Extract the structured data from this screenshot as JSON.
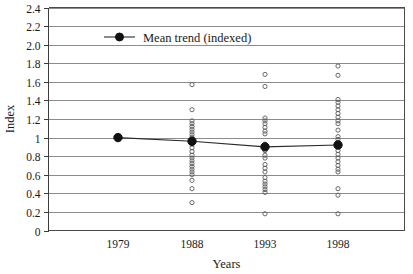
{
  "chart_data": {
    "type": "scatter",
    "title": "",
    "xlabel": "Years",
    "ylabel": "Index",
    "categories": [
      "1979",
      "1988",
      "1993",
      "1998"
    ],
    "ylim": [
      0,
      2.4
    ],
    "ytick_labels": [
      "2.4",
      "2.2",
      "2.0",
      "1.8",
      "1.6",
      "1.4",
      "1.2",
      "1",
      "0.8",
      "0.6",
      "0.4",
      "0.2",
      "0"
    ],
    "ytick_values": [
      2.4,
      2.2,
      2.0,
      1.8,
      1.6,
      1.4,
      1.2,
      1.0,
      0.8,
      0.6,
      0.4,
      0.2,
      0
    ],
    "grid": true,
    "legend_position": "top-left-inside",
    "legend": [
      {
        "name": "Mean trend (indexed)",
        "marker": "filled-circle",
        "line": "solid"
      }
    ],
    "series": [
      {
        "name": "Mean trend (indexed)",
        "type": "line",
        "x": [
          "1979",
          "1988",
          "1993",
          "1998"
        ],
        "values": [
          1.0,
          0.96,
          0.9,
          0.92
        ]
      },
      {
        "name": "Observations",
        "type": "scatter",
        "marker": "open-circle",
        "points_by_year": {
          "1979": [],
          "1988": [
            1.57,
            1.3,
            1.18,
            1.15,
            1.12,
            1.09,
            1.06,
            1.03,
            1.0,
            0.97,
            0.93,
            0.89,
            0.85,
            0.81,
            0.78,
            0.75,
            0.72,
            0.69,
            0.66,
            0.63,
            0.6,
            0.54,
            0.45,
            0.3
          ],
          "1993": [
            1.68,
            1.55,
            1.21,
            1.18,
            1.15,
            1.11,
            1.07,
            1.04,
            0.93,
            0.86,
            0.81,
            0.78,
            0.71,
            0.67,
            0.63,
            0.57,
            0.53,
            0.5,
            0.47,
            0.44,
            0.41,
            0.18
          ],
          "1998": [
            1.77,
            1.67,
            1.41,
            1.38,
            1.34,
            1.3,
            1.26,
            1.22,
            1.18,
            1.15,
            1.08,
            1.01,
            0.98,
            0.95,
            0.91,
            0.86,
            0.82,
            0.78,
            0.74,
            0.7,
            0.66,
            0.63,
            0.45,
            0.38,
            0.18
          ]
        }
      }
    ]
  },
  "axes": {
    "y_title": "Index",
    "x_title": "Years"
  },
  "colors": {
    "grid": "#8c8c8c",
    "axis": "#3d3d3d",
    "trend": "#111111",
    "observation": "#5a5a5a",
    "background": "#ffffff"
  }
}
